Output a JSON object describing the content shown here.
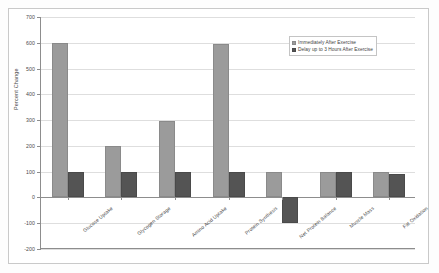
{
  "chart_data": {
    "type": "bar",
    "title": "",
    "xlabel": "",
    "ylabel": "Percent Change",
    "ylim": [
      -200,
      700
    ],
    "yticks": [
      -200,
      -100,
      0,
      100,
      200,
      300,
      400,
      500,
      600,
      700
    ],
    "ytick_labels": [
      "-200",
      "-100",
      "0",
      "100",
      "200",
      "300",
      "400",
      "500",
      "600",
      "700"
    ],
    "grid": true,
    "legend_position": "upper right",
    "categories": [
      "Glucose Uptake",
      "Glycogen Storage",
      "Amino Acid Uptake",
      "Protein Synthesis",
      "Net Protein Balance",
      "Muscle Mass",
      "Fat Oxidation"
    ],
    "series": [
      {
        "name": "Immediately After Exercise",
        "color": "#9b9b9b",
        "values": [
          600,
          200,
          295,
          595,
          100,
          100,
          100
        ]
      },
      {
        "name": "Delay up to 3 Hours After Exercise",
        "color": "#545454",
        "values": [
          100,
          100,
          100,
          100,
          -100,
          100,
          90
        ]
      }
    ]
  },
  "axis": {
    "y_title": "Percent Change"
  },
  "legend": {
    "entries": [
      "Immediately After Exercise",
      "Delay up to 3 Hours After Exercise"
    ]
  },
  "colors": {
    "series_immediate": "#9b9b9b",
    "series_delayed": "#545454",
    "grid": "#dedede",
    "axis": "#8d8d8d",
    "frame": "#c9c9c9",
    "background": "#ffffff"
  }
}
